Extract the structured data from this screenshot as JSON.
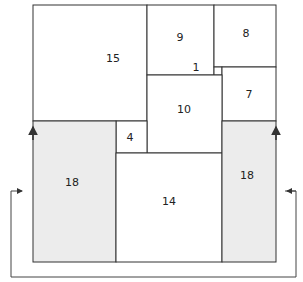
{
  "diagram": {
    "type": "square packing / tiling",
    "colors": {
      "stroke": "#333333",
      "shaded": "#ececec",
      "background": "#ffffff"
    },
    "squares": [
      {
        "id": "sq-15",
        "label": "15",
        "x": 33,
        "y": 5,
        "w": 114,
        "h": 116,
        "shaded": false
      },
      {
        "id": "sq-9",
        "label": "9",
        "x": 147,
        "y": 5,
        "w": 67,
        "h": 70,
        "shaded": false
      },
      {
        "id": "sq-8",
        "label": "8",
        "x": 214,
        "y": 5,
        "w": 62,
        "h": 62,
        "shaded": false
      },
      {
        "id": "sq-1",
        "label": "1",
        "x": 214,
        "y": 67,
        "w": 8,
        "h": 8,
        "shaded": false
      },
      {
        "id": "sq-7",
        "label": "7",
        "x": 222,
        "y": 67,
        "w": 54,
        "h": 54,
        "shaded": false
      },
      {
        "id": "sq-10",
        "label": "10",
        "x": 147,
        "y": 75,
        "w": 75,
        "h": 78,
        "shaded": false
      },
      {
        "id": "sq-4",
        "label": "4",
        "x": 116,
        "y": 121,
        "w": 31,
        "h": 32,
        "shaded": false
      },
      {
        "id": "sq-18-left",
        "label": "18",
        "x": 33,
        "y": 121,
        "w": 83,
        "h": 141,
        "shaded": true
      },
      {
        "id": "sq-14",
        "label": "14",
        "x": 116,
        "y": 153,
        "w": 106,
        "h": 109,
        "shaded": false
      },
      {
        "id": "sq-18-right",
        "label": "18",
        "x": 222,
        "y": 121,
        "w": 54,
        "h": 141,
        "shaded": true
      }
    ],
    "label_positions": {
      "sq-15": [
        113,
        59
      ],
      "sq-9": [
        180,
        38
      ],
      "sq-8": [
        246,
        34
      ],
      "sq-1": [
        196,
        68
      ],
      "sq-7": [
        249,
        95
      ],
      "sq-10": [
        184,
        110
      ],
      "sq-4": [
        130,
        138
      ],
      "sq-18-left": [
        72,
        183
      ],
      "sq-14": [
        169,
        202
      ],
      "sq-18-right": [
        247,
        176
      ]
    }
  }
}
